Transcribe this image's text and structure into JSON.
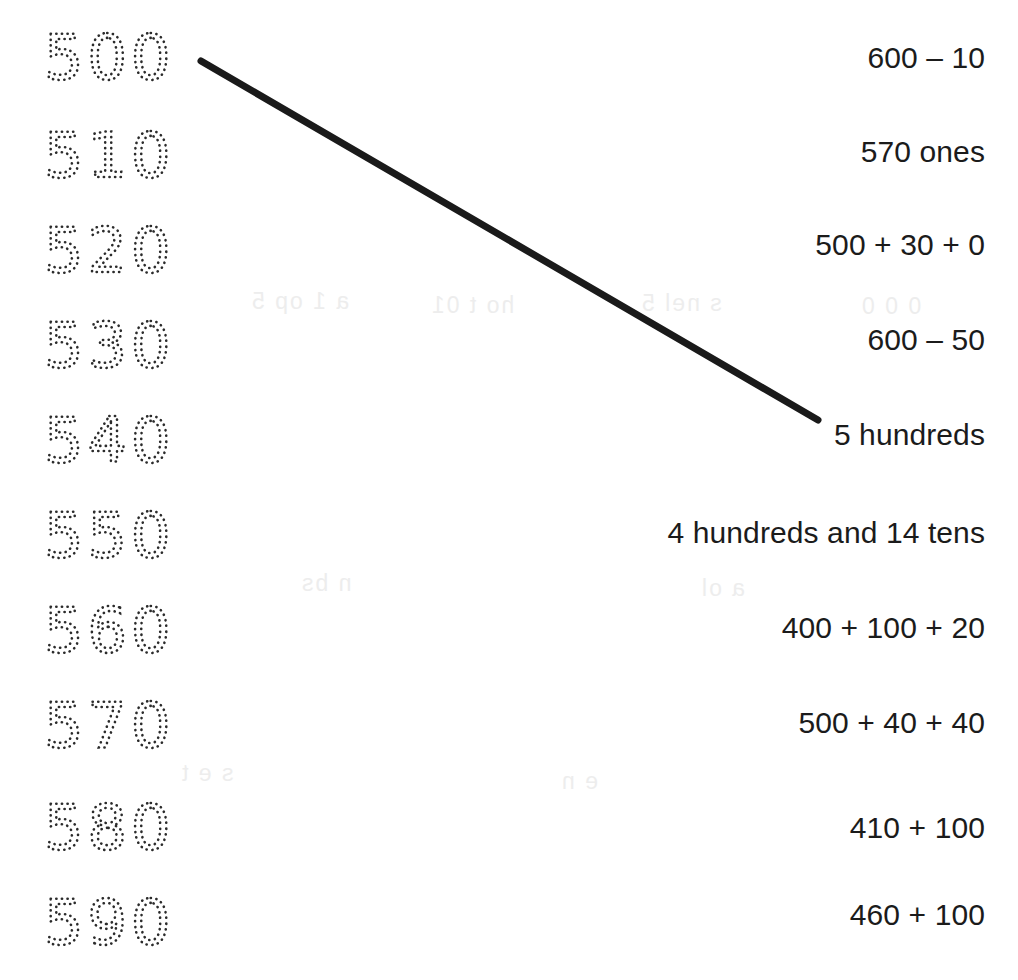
{
  "page": {
    "background_color": "#ffffff",
    "ink_color": "#1b1b1b",
    "trace_color": "#2b2b2b",
    "line_color": "#1a1a1a",
    "width": 1018,
    "height": 980
  },
  "trace_numbers": {
    "style": "dotted-tracing",
    "items": [
      {
        "value": "500",
        "y": 60
      },
      {
        "value": "510",
        "y": 158
      },
      {
        "value": "520",
        "y": 253
      },
      {
        "value": "530",
        "y": 348
      },
      {
        "value": "540",
        "y": 443
      },
      {
        "value": "550",
        "y": 538
      },
      {
        "value": "560",
        "y": 633
      },
      {
        "value": "570",
        "y": 728
      },
      {
        "value": "580",
        "y": 830
      },
      {
        "value": "590",
        "y": 925
      }
    ]
  },
  "expressions": {
    "items": [
      {
        "text": "600 – 10",
        "y": 58
      },
      {
        "text": "570 ones",
        "y": 152
      },
      {
        "text": "500 + 30 + 0",
        "y": 245
      },
      {
        "text": "600 – 50",
        "y": 340
      },
      {
        "text": "5 hundreds",
        "y": 435
      },
      {
        "text": "4 hundreds and 14 tens",
        "y": 533
      },
      {
        "text": "400 + 100 + 20",
        "y": 628
      },
      {
        "text": "500 + 40 + 40",
        "y": 723
      },
      {
        "text": "410 + 100",
        "y": 828
      },
      {
        "text": "460 + 100",
        "y": 915
      }
    ]
  },
  "match_line": {
    "from_label": "500",
    "to_label": "5 hundreds",
    "x1": 201,
    "y1": 61,
    "x2": 818,
    "y2": 420,
    "stroke_width": 7,
    "color": "#1a1a1a"
  },
  "ghosting": {
    "items": [
      {
        "text": "a 1 op 5",
        "x": 250,
        "y": 288
      },
      {
        "text": "ho t 01",
        "x": 430,
        "y": 292
      },
      {
        "text": "s nel 5",
        "x": 640,
        "y": 290
      },
      {
        "text": "0 0 0",
        "x": 860,
        "y": 293
      },
      {
        "text": "n bs",
        "x": 300,
        "y": 570
      },
      {
        "text": "a ol",
        "x": 700,
        "y": 575
      },
      {
        "text": "s e t",
        "x": 180,
        "y": 760
      },
      {
        "text": "e n",
        "x": 560,
        "y": 768
      }
    ]
  }
}
